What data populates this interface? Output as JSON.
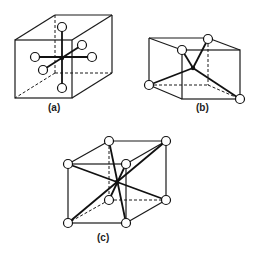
{
  "figure": {
    "panels": [
      {
        "id": "a",
        "label": "(a)",
        "description": "Octahedral coordination: six atoms around a central atom inside a cube"
      },
      {
        "id": "b",
        "label": "(b)",
        "description": "Tetrahedral coordination: four atoms on alternating cube corners around a center"
      },
      {
        "id": "c",
        "label": "(c)",
        "description": "Cubic (eightfold) coordination: eight atoms at cube corners around a center"
      }
    ]
  },
  "colors": {
    "line": "#1a1a1a",
    "atom_fill": "#ffffff",
    "background": "#ffffff"
  }
}
